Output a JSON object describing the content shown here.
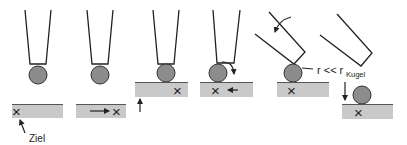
{
  "diagram": {
    "colors": {
      "line": "#222222",
      "ball_fill": "#8c8c8c",
      "plate_fill": "#c9c9c9",
      "plate_edge": "#555555"
    },
    "labels": {
      "target": "Ziel",
      "radius_relation": "r << r",
      "radius_subscript": "Kugel",
      "target_mark": "×"
    },
    "panels": [
      {
        "step": 1,
        "note": "tip holds ball above plate; target X marked"
      },
      {
        "step": 2,
        "note": "plate moves right to position target"
      },
      {
        "step": 3,
        "note": "plate raised to ball"
      },
      {
        "step": 4,
        "note": "ball rolled, plate shifted left"
      },
      {
        "step": 5,
        "note": "tip tilted away, r << r_Kugel"
      },
      {
        "step": 6,
        "note": "tip withdrawn, ball placed on target"
      }
    ]
  }
}
